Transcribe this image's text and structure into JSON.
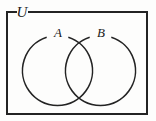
{
  "figure": {
    "type": "venn-diagram",
    "background_color": "#fdfdfc",
    "stroke_color": "#232323",
    "label_color": "#1a1a1a"
  },
  "universe": {
    "label": "U",
    "rect": {
      "x": 7,
      "y": 12,
      "width": 140,
      "height": 102
    },
    "border_width": 2,
    "label_position": {
      "x": 22,
      "y": 17
    },
    "label_gap": {
      "start": 16,
      "end": 29
    }
  },
  "sets": [
    {
      "name": "set-a",
      "label": "A",
      "center": {
        "x": 57.5,
        "y": 70.5
      },
      "radius": 35,
      "stroke_width": 1.6,
      "label_position": {
        "x": 58,
        "y": 37
      },
      "label_gap_degrees": {
        "start": -108,
        "end": -72
      }
    },
    {
      "name": "set-b",
      "label": "B",
      "center": {
        "x": 100.5,
        "y": 70.5
      },
      "radius": 35,
      "stroke_width": 1.6,
      "label_position": {
        "x": 101,
        "y": 37
      },
      "label_gap_degrees": {
        "start": -108,
        "end": -72
      }
    }
  ],
  "intersection": {
    "name": "a-intersect-b",
    "top_crossing": {
      "x": 79,
      "y": 36
    },
    "bottom_crossing": {
      "x": 79,
      "y": 105
    }
  }
}
